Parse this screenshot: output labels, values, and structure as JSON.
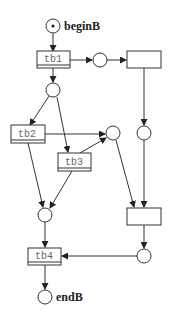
{
  "diagram": {
    "type": "petri-net",
    "places": [
      {
        "id": "beginB",
        "label": "beginB",
        "token": true
      },
      {
        "id": "p1",
        "label": ""
      },
      {
        "id": "p2",
        "label": ""
      },
      {
        "id": "p3",
        "label": ""
      },
      {
        "id": "p4",
        "label": ""
      },
      {
        "id": "p5",
        "label": ""
      },
      {
        "id": "p6",
        "label": ""
      },
      {
        "id": "endB",
        "label": "endB",
        "token": false
      }
    ],
    "transitions": [
      {
        "id": "tb1",
        "label": "tb1"
      },
      {
        "id": "tb2",
        "label": "tb2"
      },
      {
        "id": "tb3",
        "label": "tb3"
      },
      {
        "id": "tb4",
        "label": "tb4"
      },
      {
        "id": "t_right_top",
        "label": ""
      },
      {
        "id": "t_right_bottom",
        "label": ""
      }
    ],
    "arcs": [
      [
        "beginB",
        "tb1"
      ],
      [
        "tb1",
        "p1"
      ],
      [
        "tb1",
        "p2"
      ],
      [
        "p2",
        "t_right_top"
      ],
      [
        "p1",
        "tb2"
      ],
      [
        "p1",
        "tb3"
      ],
      [
        "tb2",
        "p3"
      ],
      [
        "tb3",
        "p3"
      ],
      [
        "tb2",
        "p5"
      ],
      [
        "tb3",
        "p5"
      ],
      [
        "t_right_top",
        "p4"
      ],
      [
        "p3",
        "t_right_bottom"
      ],
      [
        "p4",
        "t_right_bottom"
      ],
      [
        "t_right_bottom",
        "p6"
      ],
      [
        "p6",
        "tb4"
      ],
      [
        "p5",
        "tb4"
      ],
      [
        "tb4",
        "endB"
      ]
    ]
  }
}
